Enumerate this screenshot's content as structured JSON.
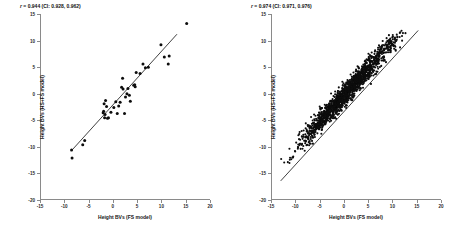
{
  "chart_data": [
    {
      "type": "scatter",
      "panel": "left",
      "title": "",
      "xlabel": "Height BVs (FS model)",
      "ylabel": "Height BVs (HS+FS model)",
      "annotation": "r = 0.944 (CI: 0.928, 0.962)",
      "r": 0.944,
      "ci": [
        0.928,
        0.962
      ],
      "xlim": [
        -15,
        20
      ],
      "ylim": [
        -20,
        15
      ],
      "xticks": [
        -15,
        -10,
        -5,
        0,
        5,
        10,
        15,
        20
      ],
      "yticks": [
        15,
        10,
        5,
        0,
        -5,
        -10,
        -15,
        -20
      ],
      "grid": false,
      "legend": "none",
      "fit_line": {
        "x1": -8.6,
        "y1": -10.8,
        "x2": 13.2,
        "y2": 11.2
      },
      "points": [
        [
          -8.4,
          -12.1
        ],
        [
          -8.5,
          -10.6
        ],
        [
          -5.8,
          -8.8
        ],
        [
          -6.2,
          -9.6
        ],
        [
          -2.0,
          -3.6
        ],
        [
          -1.9,
          -3.3
        ],
        [
          -1.6,
          -3.9
        ],
        [
          -1.7,
          -4.5
        ],
        [
          -1.3,
          -2.4
        ],
        [
          -1.1,
          -4.6
        ],
        [
          -0.9,
          -4.5
        ],
        [
          -0.4,
          -3.5
        ],
        [
          -1.8,
          -1.9
        ],
        [
          -1.5,
          -1.3
        ],
        [
          0.2,
          -2.6
        ],
        [
          0.6,
          -1.5
        ],
        [
          0.9,
          -3.7
        ],
        [
          1.2,
          -2.3
        ],
        [
          1.5,
          -1.6
        ],
        [
          1.8,
          1.2
        ],
        [
          2.0,
          2.9
        ],
        [
          2.1,
          0.9
        ],
        [
          2.4,
          -3.7
        ],
        [
          2.6,
          -0.6
        ],
        [
          2.9,
          0.0
        ],
        [
          3.1,
          1.0
        ],
        [
          3.4,
          -0.3
        ],
        [
          3.6,
          -1.4
        ],
        [
          4.3,
          1.6
        ],
        [
          4.5,
          1.7
        ],
        [
          4.6,
          1.3
        ],
        [
          4.8,
          4.0
        ],
        [
          5.6,
          3.8
        ],
        [
          6.2,
          5.6
        ],
        [
          6.7,
          4.9
        ],
        [
          7.3,
          5.0
        ],
        [
          9.9,
          9.2
        ],
        [
          10.6,
          6.9
        ],
        [
          11.4,
          5.6
        ],
        [
          11.6,
          7.1
        ],
        [
          15.2,
          13.2
        ]
      ]
    },
    {
      "type": "scatter",
      "panel": "right",
      "title": "",
      "xlabel": "Height BVs (FS model)",
      "ylabel": "Height BVs (HS+FS model)",
      "annotation": "r = 0.974 (CI: 0.971, 0.976)",
      "r": 0.974,
      "ci": [
        0.971,
        0.976
      ],
      "xlim": [
        -15,
        20
      ],
      "ylim": [
        -20,
        15
      ],
      "xticks": [
        -15,
        -10,
        -5,
        0,
        5,
        10,
        15,
        20
      ],
      "yticks": [
        15,
        10,
        5,
        0,
        -5,
        -10,
        -15,
        -20
      ],
      "grid": false,
      "legend": "none",
      "fit_line": {
        "x1": -13.0,
        "y1": -16.4,
        "x2": 15.3,
        "y2": 11.9
      },
      "cloud": {
        "n": 1600,
        "x_range": [
          -13.0,
          15.3
        ],
        "y_range": [
          -16.4,
          11.9
        ],
        "slope": 1.0,
        "intercept": -0.35,
        "residual_sd": 1.05,
        "density_center": [
          1.0,
          0.6
        ],
        "density_sd": 5.0
      }
    }
  ],
  "axes": {
    "xticks": [
      "-15",
      "-10",
      "-5",
      "0",
      "5",
      "10",
      "15",
      "20"
    ],
    "yticks": [
      "15",
      "10",
      "5",
      "0",
      "-5",
      "-10",
      "-15",
      "-20"
    ]
  },
  "left_panel": {
    "annotation": "r = 0.944 (CI: 0.928, 0.962)",
    "annotation_r": "r",
    "annotation_rest": " = 0.944 (CI: 0.928, 0.962)",
    "xlabel": "Height BVs (FS model)",
    "ylabel": "Height BVs (HS+FS model)"
  },
  "right_panel": {
    "annotation": "r = 0.974 (CI: 0.971, 0.976)",
    "annotation_r": "r",
    "annotation_rest": " = 0.974 (CI: 0.971, 0.976)",
    "xlabel": "Height BVs (FS model)",
    "ylabel": "Height BVs (HS+FS model)"
  },
  "colors": {
    "point": "#0d0d0d",
    "line": "#101010",
    "axis": "#8a8a8a",
    "background": "#ffffff"
  }
}
